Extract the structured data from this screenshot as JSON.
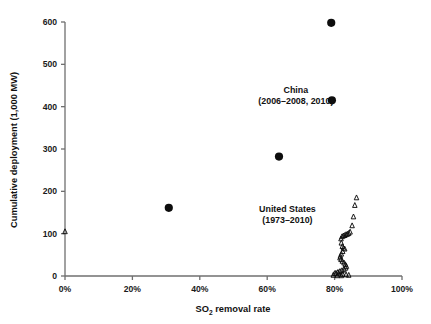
{
  "chart_data": {
    "type": "scatter",
    "title": "",
    "xlabel": "SO2 removal rate",
    "xlabel_rich": {
      "pre": "SO",
      "sub": "2",
      "post": " removal rate"
    },
    "ylabel": "Cumulative deployment (1,000 MW)",
    "xlim": [
      0,
      100
    ],
    "ylim": [
      0,
      600
    ],
    "x_unit": "%",
    "grid": false,
    "legend": "none",
    "xticks": [
      0,
      20,
      40,
      60,
      80,
      100
    ],
    "xticklabels": [
      "0%",
      "20%",
      "40%",
      "60%",
      "80%",
      "100%"
    ],
    "yticks": [
      0,
      100,
      200,
      300,
      400,
      500,
      600
    ],
    "yticklabels": [
      "0",
      "100",
      "200",
      "300",
      "400",
      "500",
      "600"
    ],
    "annotations": [
      {
        "name": "china-label",
        "line1": "China",
        "line2": "(2006–2008, 2010)",
        "x": 68.5,
        "y": 432
      },
      {
        "name": "united-states-label",
        "line1": "United States",
        "line2": "(1973–2010)",
        "x": 66.0,
        "y": 152
      }
    ],
    "series": [
      {
        "name": "China",
        "marker": "filled-circle",
        "color": "#0d0d0d",
        "points": [
          {
            "x": 79.0,
            "y": 598
          },
          {
            "x": 79.2,
            "y": 415
          },
          {
            "x": 63.5,
            "y": 282
          },
          {
            "x": 30.8,
            "y": 161
          }
        ]
      },
      {
        "name": "United States",
        "marker": "open-triangle",
        "color": "#0d0d0d",
        "points": [
          {
            "x": 0.0,
            "y": 105
          },
          {
            "x": 86.5,
            "y": 185
          },
          {
            "x": 86.0,
            "y": 167
          },
          {
            "x": 85.6,
            "y": 140
          },
          {
            "x": 85.2,
            "y": 119
          },
          {
            "x": 84.6,
            "y": 104
          },
          {
            "x": 84.2,
            "y": 101
          },
          {
            "x": 83.8,
            "y": 99
          },
          {
            "x": 83.4,
            "y": 98
          },
          {
            "x": 83.0,
            "y": 96
          },
          {
            "x": 82.6,
            "y": 95
          },
          {
            "x": 82.2,
            "y": 93
          },
          {
            "x": 81.9,
            "y": 88
          },
          {
            "x": 82.0,
            "y": 78
          },
          {
            "x": 82.3,
            "y": 70
          },
          {
            "x": 82.6,
            "y": 66
          },
          {
            "x": 83.0,
            "y": 64
          },
          {
            "x": 82.4,
            "y": 58
          },
          {
            "x": 82.0,
            "y": 52
          },
          {
            "x": 81.7,
            "y": 47
          },
          {
            "x": 81.6,
            "y": 43
          },
          {
            "x": 81.9,
            "y": 39
          },
          {
            "x": 82.3,
            "y": 35
          },
          {
            "x": 82.8,
            "y": 31
          },
          {
            "x": 83.2,
            "y": 27
          },
          {
            "x": 83.5,
            "y": 23
          },
          {
            "x": 83.3,
            "y": 19
          },
          {
            "x": 82.8,
            "y": 16
          },
          {
            "x": 82.2,
            "y": 13
          },
          {
            "x": 81.6,
            "y": 11
          },
          {
            "x": 81.0,
            "y": 9
          },
          {
            "x": 80.4,
            "y": 7
          },
          {
            "x": 80.0,
            "y": 6
          },
          {
            "x": 81.2,
            "y": 5
          },
          {
            "x": 82.4,
            "y": 4
          },
          {
            "x": 83.4,
            "y": 3
          },
          {
            "x": 84.2,
            "y": 2
          },
          {
            "x": 79.6,
            "y": 2
          },
          {
            "x": 80.8,
            "y": 1
          },
          {
            "x": 82.0,
            "y": 1
          }
        ]
      }
    ]
  },
  "axes": {
    "y_title": "Cumulative deployment (1,000 MW)"
  }
}
